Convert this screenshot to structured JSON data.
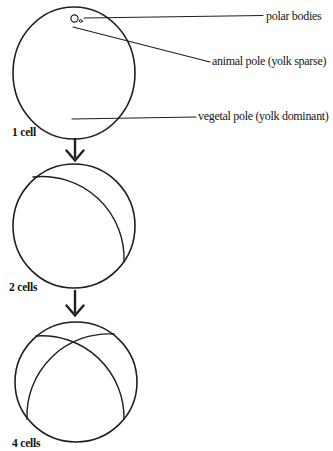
{
  "figure": {
    "annotations": {
      "polar_bodies": "polar bodies",
      "animal_pole": "animal pole (yolk sparse)",
      "vegetal_pole": "vegetal pole (yolk dominant)"
    },
    "stages": [
      {
        "label": "1 cell"
      },
      {
        "label": "2 cells"
      },
      {
        "label": "4 cells"
      }
    ],
    "colors": {
      "ink": "#1f1f1f",
      "background": "#ffffff"
    }
  }
}
